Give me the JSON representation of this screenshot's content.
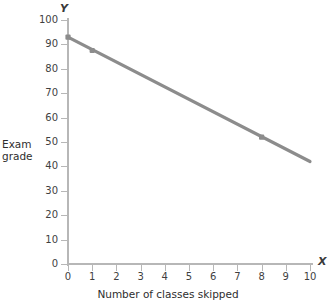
{
  "chart_data": {
    "type": "line",
    "title": "",
    "xlabel": "Number of classes skipped",
    "ylabel": "Exam grade",
    "x_axis_symbol": "X",
    "y_axis_symbol": "Y",
    "xlim": [
      0,
      10
    ],
    "ylim": [
      0,
      100
    ],
    "xticks": [
      0,
      1,
      2,
      3,
      4,
      5,
      6,
      7,
      8,
      9,
      10
    ],
    "yticks": [
      0,
      10,
      20,
      30,
      40,
      50,
      60,
      70,
      80,
      90,
      100
    ],
    "xtick_labels": [
      "0",
      "1",
      "2",
      "3",
      "4",
      "5",
      "6",
      "7",
      "8",
      "9",
      "10"
    ],
    "ytick_labels": [
      "0",
      "10",
      "20",
      "30",
      "40",
      "50",
      "60",
      "70",
      "80",
      "90",
      "100"
    ],
    "grid": false,
    "legend": false,
    "line_color": "#8c8c8c",
    "axis_color": "#b7b7b7",
    "marker_color": "#8c8c8c",
    "series": [
      {
        "name": "Exam grade vs classes skipped",
        "x": [
          0,
          10
        ],
        "y": [
          93,
          42
        ],
        "markers": [
          {
            "x": 0,
            "y": 93
          },
          {
            "x": 1,
            "y": 87.5
          },
          {
            "x": 8,
            "y": 52
          }
        ]
      }
    ]
  }
}
